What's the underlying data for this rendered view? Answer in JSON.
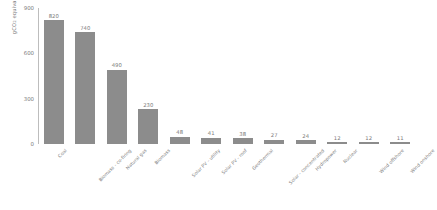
{
  "chart_data": {
    "type": "bar",
    "title": "",
    "xlabel": "",
    "ylabel": "gCO2 equivalent per kWh",
    "ylabel_parts": {
      "prefix": "gCO",
      "sub": "2",
      "suffix": " equivalent per kWh"
    },
    "ylim": [
      0,
      900
    ],
    "yticks": [
      0,
      300,
      600,
      900
    ],
    "ytick_labels": [
      "0",
      "300",
      "600",
      "900"
    ],
    "grid": false,
    "legend": null,
    "bar_color": "#8c8c8c",
    "value_labels_shown": true,
    "categories": [
      "Coal",
      "Biomass - co-firing",
      "Natural gas",
      "Biomass",
      "Solar PV - utility",
      "Solar PV - roof",
      "Geothermal",
      "Solar - concentrated",
      "Hydropower",
      "Nuclear",
      "Wind offshore",
      "Wind onshore"
    ],
    "values": [
      820,
      740,
      490,
      230,
      48,
      41,
      38,
      27,
      24,
      12,
      12,
      11
    ],
    "value_labels": [
      "820",
      "740",
      "490",
      "230",
      "48",
      "41",
      "38",
      "27",
      "24",
      "12",
      "12",
      "11"
    ]
  }
}
